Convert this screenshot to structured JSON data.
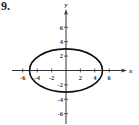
{
  "problem": {
    "label": "9."
  },
  "chart_data": {
    "type": "line",
    "title": "",
    "xlabel": "x",
    "ylabel": "y",
    "xlim": [
      -7,
      8
    ],
    "ylim": [
      -8,
      8
    ],
    "grid": false,
    "legend": null,
    "x_ticks": [
      -6,
      -4,
      -2,
      2,
      4,
      6
    ],
    "x_tick_labels": [
      "-6",
      "-4",
      "-2",
      "2",
      "4",
      "6"
    ],
    "y_ticks": [
      -6,
      -4,
      -2,
      2,
      4,
      6
    ],
    "y_tick_labels": [
      "-6",
      "-4",
      "-2",
      "2",
      "4",
      "6"
    ],
    "series": [
      {
        "name": "ellipse",
        "shape": "ellipse",
        "center": [
          0,
          0
        ],
        "semi_major_x": 5,
        "semi_minor_y": 3,
        "equation": "x^2/25 + y^2/9 = 1",
        "key_points": [
          [
            5,
            0
          ],
          [
            -5,
            0
          ],
          [
            0,
            3
          ],
          [
            0,
            -3
          ]
        ]
      }
    ]
  },
  "colors": {
    "axis": "#333333",
    "curve": "#111111",
    "background": "#ffffff"
  }
}
